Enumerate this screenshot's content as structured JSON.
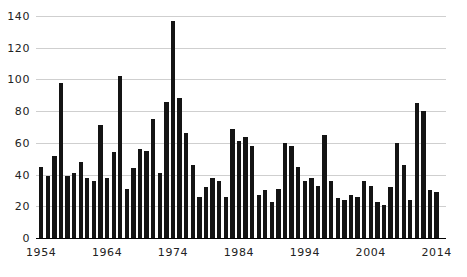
{
  "chart_data": {
    "type": "bar",
    "title": "",
    "subtitle": "",
    "xlabel": "",
    "ylabel": "",
    "xlim": [
      1954,
      2014
    ],
    "ylim": [
      0,
      140
    ],
    "ytick_interval": 20,
    "xtick_interval": 10,
    "grid": true,
    "grid_color": "#cfcfcf",
    "bar_color": "#141414",
    "legend": null,
    "legend_position": "none",
    "annotations": [],
    "ytick_labels": [
      "0",
      "20",
      "40",
      "60",
      "80",
      "100",
      "120",
      "140"
    ],
    "ytick_values": [
      0,
      20,
      40,
      60,
      80,
      100,
      120,
      140
    ],
    "xtick_labels": [
      "1954",
      "1964",
      "1974",
      "1984",
      "1994",
      "2004",
      "2014"
    ],
    "xtick_values": [
      1954,
      1964,
      1974,
      1984,
      1994,
      2004,
      2014
    ],
    "categories": [
      1954,
      1955,
      1956,
      1957,
      1958,
      1959,
      1960,
      1961,
      1962,
      1963,
      1964,
      1965,
      1966,
      1967,
      1968,
      1969,
      1970,
      1971,
      1972,
      1973,
      1974,
      1975,
      1976,
      1977,
      1978,
      1979,
      1980,
      1981,
      1982,
      1983,
      1984,
      1985,
      1986,
      1987,
      1988,
      1989,
      1990,
      1991,
      1992,
      1993,
      1994,
      1995,
      1996,
      1997,
      1998,
      1999,
      2000,
      2001,
      2002,
      2003,
      2004,
      2005,
      2006,
      2007,
      2008,
      2009,
      2010,
      2011,
      2012,
      2013,
      2014
    ],
    "values": [
      45,
      39,
      52,
      98,
      39,
      41,
      48,
      38,
      36,
      71,
      38,
      54,
      102,
      31,
      44,
      56,
      55,
      75,
      41,
      86,
      137,
      88,
      66,
      46,
      26,
      32,
      38,
      36,
      26,
      69,
      61,
      64,
      58,
      27,
      30,
      23,
      31,
      60,
      58,
      45,
      36,
      38,
      33,
      65,
      36,
      25,
      24,
      27,
      26,
      36,
      33,
      23,
      21,
      32,
      60,
      46,
      24,
      85,
      80,
      30,
      29
    ]
  }
}
